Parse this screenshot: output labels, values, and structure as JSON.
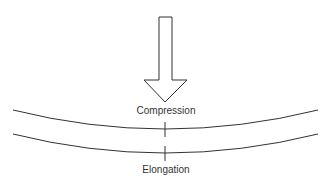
{
  "diagram": {
    "type": "beam-bending",
    "labels": {
      "top": "Compression",
      "bottom": "Elongation"
    },
    "elements": {
      "arrow": "force-arrow-down",
      "upper_surface": "curved-line",
      "lower_surface": "curved-line"
    },
    "colors": {
      "stroke": "#333333",
      "background": "#ffffff"
    }
  }
}
